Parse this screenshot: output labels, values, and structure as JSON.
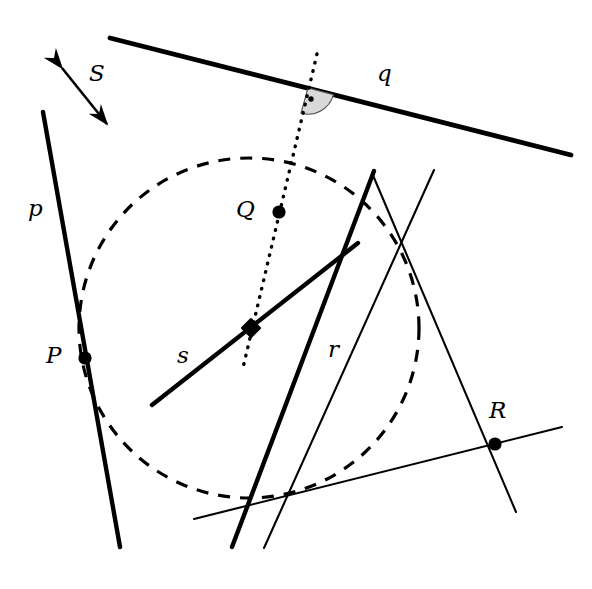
{
  "figure": {
    "kind": "geometry-diagram",
    "width": 592,
    "height": 589,
    "background_color": "#ffffff",
    "stroke_color": "#000000",
    "angle_marker_fill": "#d9d9d9"
  },
  "labels": {
    "line_p": "p",
    "line_q": "q",
    "line_r": "r",
    "line_s": "s",
    "vector_S": "S",
    "point_P": "P",
    "point_Q": "Q",
    "point_R": "R"
  },
  "geometry": {
    "circle": {
      "name": "dashed-circle",
      "cx": 249,
      "cy": 328,
      "r": 170,
      "style": "dashed"
    },
    "lines": [
      {
        "name": "line-p",
        "label": "p",
        "x1": 43,
        "y1": 112,
        "x2": 120,
        "y2": 547,
        "weight": "thick"
      },
      {
        "name": "line-q",
        "label": "q",
        "x1": 110,
        "y1": 38,
        "x2": 571,
        "y2": 155,
        "weight": "thick"
      },
      {
        "name": "line-r",
        "label": "r",
        "x1": 232,
        "y1": 547,
        "x2": 374,
        "y2": 171,
        "weight": "thick"
      },
      {
        "name": "line-s",
        "label": "s",
        "x1": 152,
        "y1": 405,
        "x2": 358,
        "y2": 243,
        "weight": "thick"
      },
      {
        "name": "thin-line-through-R-steep",
        "label": "",
        "x1": 372,
        "y1": 173,
        "x2": 516,
        "y2": 512,
        "weight": "thin"
      },
      {
        "name": "thin-line-secant-lower-left",
        "label": "",
        "x1": 434,
        "y1": 170,
        "x2": 264,
        "y2": 548,
        "weight": "thin"
      },
      {
        "name": "thin-line-tangent-bottom",
        "label": "",
        "x1": 194,
        "y1": 519,
        "x2": 562,
        "y2": 427,
        "weight": "thin"
      }
    ],
    "dotted_line": {
      "name": "dotted-axis-line",
      "x1": 317,
      "y1": 54,
      "x2": 242,
      "y2": 372,
      "style": "dotted"
    },
    "arrow": {
      "name": "double-arrow-S",
      "x1": 56,
      "y1": 58,
      "x2": 113,
      "y2": 133,
      "double_headed": true
    },
    "angle_marker": {
      "name": "right-angle-marker",
      "cx": 308,
      "cy": 88,
      "radius": 26,
      "dot_radius": 2.6
    },
    "points": [
      {
        "name": "point-P",
        "label": "P",
        "x": 85,
        "y": 358,
        "r": 6.5,
        "label_x": 46,
        "label_y": 345
      },
      {
        "name": "point-Q",
        "label": "Q",
        "x": 279,
        "y": 212,
        "r": 6.5,
        "label_x": 235,
        "label_y": 199
      },
      {
        "name": "point-R",
        "label": "R",
        "x": 495,
        "y": 444,
        "r": 6.5,
        "label_x": 492,
        "label_y": 400
      }
    ],
    "diamond": {
      "name": "diamond-marker-center",
      "x": 251,
      "y": 328,
      "size": 11
    },
    "label_positions": {
      "p": {
        "x": 28,
        "y": 208
      },
      "q": {
        "x": 377,
        "y": 62
      },
      "r": {
        "x": 328,
        "y": 338
      },
      "s": {
        "x": 177,
        "y": 344
      },
      "S": {
        "x": 89,
        "y": 62
      }
    }
  }
}
